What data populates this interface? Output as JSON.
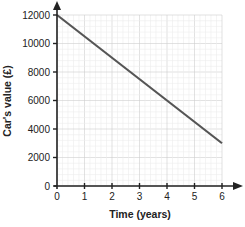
{
  "chart_data": {
    "type": "line",
    "title": "",
    "xlabel": "Time (years)",
    "ylabel": "Car's value (£)",
    "x": [
      0,
      6
    ],
    "series": [
      {
        "name": "Car's value",
        "values": [
          12000,
          3000
        ],
        "color": "#555555"
      }
    ],
    "xticks": [
      "0",
      "1",
      "2",
      "3",
      "4",
      "5",
      "6"
    ],
    "yticks": [
      "0",
      "2000",
      "4000",
      "6000",
      "8000",
      "10000",
      "12000"
    ],
    "xlim": [
      0,
      6
    ],
    "ylim": [
      0,
      12000
    ],
    "grid": true,
    "legend": "none"
  }
}
